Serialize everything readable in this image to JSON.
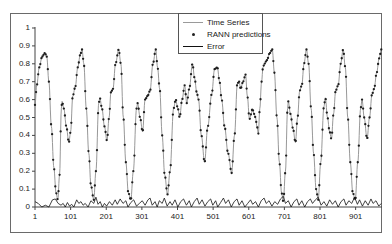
{
  "chart_data": {
    "type": "line",
    "title": "",
    "xlabel": "",
    "ylabel": "",
    "ylim": [
      0,
      1
    ],
    "xlim": [
      1,
      975
    ],
    "grid": false,
    "legend_position": "top-center-inside",
    "y_ticks": [
      "0",
      "0.1",
      "0.2",
      "0.3",
      "0.4",
      "0.5",
      "0.6",
      "0.7",
      "0.8",
      "0.9",
      "1"
    ],
    "x_ticks": [
      "1",
      "101",
      "201",
      "301",
      "401",
      "501",
      "601",
      "701",
      "801",
      "901"
    ],
    "legend": [
      "Time Series",
      "RANN predictions",
      "Error"
    ],
    "series": [
      {
        "name": "Time Series",
        "style": "line",
        "color": "#8c8c8c",
        "points": [
          [
            1,
            0.57
          ],
          [
            6,
            0.68
          ],
          [
            13,
            0.78
          ],
          [
            21,
            0.84
          ],
          [
            29,
            0.86
          ],
          [
            34,
            0.84
          ],
          [
            40,
            0.7
          ],
          [
            47,
            0.45
          ],
          [
            54,
            0.22
          ],
          [
            60,
            0.08
          ],
          [
            65,
            0.04
          ],
          [
            70,
            0.18
          ],
          [
            75,
            0.55
          ],
          [
            77,
            0.59
          ],
          [
            82,
            0.55
          ],
          [
            89,
            0.45
          ],
          [
            96,
            0.36
          ],
          [
            101,
            0.42
          ],
          [
            107,
            0.62
          ],
          [
            114,
            0.67
          ],
          [
            121,
            0.78
          ],
          [
            128,
            0.85
          ],
          [
            133,
            0.88
          ],
          [
            138,
            0.8
          ],
          [
            145,
            0.55
          ],
          [
            152,
            0.3
          ],
          [
            158,
            0.12
          ],
          [
            166,
            0.04
          ],
          [
            172,
            0.2
          ],
          [
            180,
            0.58
          ],
          [
            183,
            0.61
          ],
          [
            189,
            0.55
          ],
          [
            196,
            0.45
          ],
          [
            203,
            0.37
          ],
          [
            209,
            0.5
          ],
          [
            214,
            0.64
          ],
          [
            220,
            0.66
          ],
          [
            227,
            0.8
          ],
          [
            236,
            0.88
          ],
          [
            242,
            0.8
          ],
          [
            249,
            0.5
          ],
          [
            256,
            0.25
          ],
          [
            263,
            0.08
          ],
          [
            270,
            0.04
          ],
          [
            277,
            0.2
          ],
          [
            286,
            0.55
          ],
          [
            289,
            0.58
          ],
          [
            296,
            0.5
          ],
          [
            303,
            0.42
          ],
          [
            310,
            0.6
          ],
          [
            317,
            0.62
          ],
          [
            324,
            0.65
          ],
          [
            332,
            0.8
          ],
          [
            340,
            0.88
          ],
          [
            345,
            0.78
          ],
          [
            351,
            0.66
          ],
          [
            358,
            0.4
          ],
          [
            365,
            0.18
          ],
          [
            373,
            0.07
          ],
          [
            380,
            0.2
          ],
          [
            390,
            0.55
          ],
          [
            396,
            0.6
          ],
          [
            402,
            0.55
          ],
          [
            407,
            0.5
          ],
          [
            414,
            0.6
          ],
          [
            421,
            0.68
          ],
          [
            427,
            0.58
          ],
          [
            434,
            0.66
          ],
          [
            443,
            0.8
          ],
          [
            449,
            0.72
          ],
          [
            455,
            0.64
          ],
          [
            460,
            0.6
          ],
          [
            468,
            0.4
          ],
          [
            477,
            0.25
          ],
          [
            486,
            0.45
          ],
          [
            497,
            0.63
          ],
          [
            505,
            0.77
          ],
          [
            513,
            0.78
          ],
          [
            519,
            0.7
          ],
          [
            525,
            0.6
          ],
          [
            533,
            0.45
          ],
          [
            543,
            0.3
          ],
          [
            553,
            0.19
          ],
          [
            561,
            0.4
          ],
          [
            569,
            0.69
          ],
          [
            574,
            0.7
          ],
          [
            578,
            0.66
          ],
          [
            585,
            0.7
          ],
          [
            592,
            0.74
          ],
          [
            597,
            0.62
          ],
          [
            603,
            0.49
          ],
          [
            608,
            0.52
          ],
          [
            611,
            0.55
          ],
          [
            616,
            0.52
          ],
          [
            620,
            0.5
          ],
          [
            624,
            0.45
          ],
          [
            628,
            0.41
          ],
          [
            632,
            0.55
          ],
          [
            637,
            0.7
          ],
          [
            641,
            0.78
          ],
          [
            645,
            0.8
          ],
          [
            652,
            0.82
          ],
          [
            660,
            0.86
          ],
          [
            667,
            0.88
          ],
          [
            673,
            0.75
          ],
          [
            680,
            0.5
          ],
          [
            687,
            0.25
          ],
          [
            693,
            0.08
          ],
          [
            698,
            0.03
          ],
          [
            704,
            0.2
          ],
          [
            710,
            0.55
          ],
          [
            712,
            0.59
          ],
          [
            718,
            0.52
          ],
          [
            725,
            0.44
          ],
          [
            732,
            0.36
          ],
          [
            738,
            0.5
          ],
          [
            744,
            0.65
          ],
          [
            750,
            0.68
          ],
          [
            756,
            0.8
          ],
          [
            763,
            0.88
          ],
          [
            769,
            0.8
          ],
          [
            776,
            0.55
          ],
          [
            783,
            0.3
          ],
          [
            790,
            0.1
          ],
          [
            796,
            0.04
          ],
          [
            803,
            0.25
          ],
          [
            812,
            0.56
          ],
          [
            816,
            0.61
          ],
          [
            822,
            0.5
          ],
          [
            828,
            0.42
          ],
          [
            833,
            0.38
          ],
          [
            839,
            0.52
          ],
          [
            845,
            0.65
          ],
          [
            852,
            0.68
          ],
          [
            859,
            0.8
          ],
          [
            866,
            0.88
          ],
          [
            872,
            0.78
          ],
          [
            879,
            0.5
          ],
          [
            886,
            0.25
          ],
          [
            893,
            0.08
          ],
          [
            900,
            0.04
          ],
          [
            907,
            0.25
          ],
          [
            915,
            0.55
          ],
          [
            919,
            0.6
          ],
          [
            925,
            0.5
          ],
          [
            933,
            0.38
          ],
          [
            940,
            0.5
          ],
          [
            947,
            0.63
          ],
          [
            953,
            0.66
          ],
          [
            960,
            0.75
          ],
          [
            967,
            0.83
          ],
          [
            973,
            0.88
          ]
        ]
      },
      {
        "name": "RANN predictions",
        "style": "markers",
        "marker": "dot",
        "color": "#1e1e1e",
        "note": "Predictions closely track the Time Series values at each index"
      },
      {
        "name": "Error",
        "style": "line",
        "color": "#111111",
        "range": [
          0,
          0.06
        ],
        "points": [
          [
            1,
            0.03
          ],
          [
            10,
            0.02
          ],
          [
            20,
            0.0
          ],
          [
            30,
            0.01
          ],
          [
            40,
            0.0
          ],
          [
            50,
            0.04
          ],
          [
            58,
            0.045
          ],
          [
            66,
            0.02
          ],
          [
            74,
            0.01
          ],
          [
            80,
            0.02
          ],
          [
            86,
            0.0
          ],
          [
            92,
            0.025
          ],
          [
            98,
            0.005
          ],
          [
            104,
            0.015
          ],
          [
            110,
            0.0
          ],
          [
            118,
            0.04
          ],
          [
            124,
            0.02
          ],
          [
            130,
            0.03
          ],
          [
            136,
            0.01
          ],
          [
            142,
            0.02
          ],
          [
            150,
            0.0
          ],
          [
            158,
            0.035
          ],
          [
            166,
            0.02
          ],
          [
            172,
            0.055
          ],
          [
            178,
            0.015
          ],
          [
            184,
            0.03
          ],
          [
            190,
            0.0
          ],
          [
            196,
            0.02
          ],
          [
            202,
            0.005
          ],
          [
            210,
            0.03
          ],
          [
            218,
            0.01
          ],
          [
            226,
            0.04
          ],
          [
            232,
            0.015
          ],
          [
            240,
            0.045
          ],
          [
            248,
            0.02
          ],
          [
            256,
            0.035
          ],
          [
            262,
            0.0
          ],
          [
            270,
            0.025
          ],
          [
            278,
            0.04
          ],
          [
            286,
            0.005
          ],
          [
            294,
            0.02
          ],
          [
            302,
            0.035
          ],
          [
            310,
            0.01
          ],
          [
            318,
            0.04
          ],
          [
            324,
            0.05
          ],
          [
            330,
            0.01
          ],
          [
            338,
            0.03
          ],
          [
            344,
            0.0
          ],
          [
            350,
            0.035
          ],
          [
            358,
            0.02
          ],
          [
            364,
            0.05
          ],
          [
            372,
            0.005
          ],
          [
            380,
            0.03
          ],
          [
            386,
            0.01
          ],
          [
            394,
            0.04
          ],
          [
            402,
            0.0
          ],
          [
            410,
            0.03
          ],
          [
            418,
            0.045
          ],
          [
            426,
            0.01
          ],
          [
            434,
            0.035
          ],
          [
            440,
            0.0
          ],
          [
            448,
            0.03
          ],
          [
            456,
            0.05
          ],
          [
            462,
            0.015
          ],
          [
            470,
            0.04
          ],
          [
            478,
            0.005
          ],
          [
            486,
            0.03
          ],
          [
            494,
            0.045
          ],
          [
            500,
            0.01
          ],
          [
            508,
            0.035
          ],
          [
            514,
            0.0
          ],
          [
            522,
            0.025
          ],
          [
            530,
            0.05
          ],
          [
            536,
            0.02
          ],
          [
            544,
            0.04
          ],
          [
            552,
            0.0
          ],
          [
            560,
            0.03
          ],
          [
            568,
            0.045
          ],
          [
            574,
            0.01
          ],
          [
            582,
            0.035
          ],
          [
            590,
            0.0
          ],
          [
            598,
            0.02
          ],
          [
            606,
            0.04
          ],
          [
            612,
            0.015
          ],
          [
            620,
            0.03
          ],
          [
            628,
            0.0
          ],
          [
            636,
            0.035
          ],
          [
            644,
            0.05
          ],
          [
            650,
            0.02
          ],
          [
            658,
            0.035
          ],
          [
            666,
            0.005
          ],
          [
            674,
            0.03
          ],
          [
            682,
            0.015
          ],
          [
            690,
            0.045
          ],
          [
            698,
            0.06
          ],
          [
            704,
            0.02
          ],
          [
            712,
            0.035
          ],
          [
            720,
            0.0
          ],
          [
            728,
            0.03
          ],
          [
            736,
            0.045
          ],
          [
            742,
            0.01
          ],
          [
            750,
            0.035
          ],
          [
            758,
            0.0
          ],
          [
            766,
            0.03
          ],
          [
            774,
            0.045
          ],
          [
            780,
            0.02
          ],
          [
            788,
            0.04
          ],
          [
            796,
            0.055
          ],
          [
            804,
            0.01
          ],
          [
            812,
            0.03
          ],
          [
            820,
            0.005
          ],
          [
            828,
            0.04
          ],
          [
            836,
            0.015
          ],
          [
            844,
            0.035
          ],
          [
            852,
            0.0
          ],
          [
            860,
            0.03
          ],
          [
            868,
            0.045
          ],
          [
            874,
            0.01
          ],
          [
            882,
            0.035
          ],
          [
            890,
            0.02
          ],
          [
            898,
            0.055
          ],
          [
            906,
            0.015
          ],
          [
            912,
            0.04
          ],
          [
            920,
            0.005
          ],
          [
            928,
            0.035
          ],
          [
            936,
            0.01
          ],
          [
            944,
            0.045
          ],
          [
            950,
            0.02
          ],
          [
            958,
            0.035
          ],
          [
            966,
            0.005
          ],
          [
            973,
            0.02
          ]
        ]
      }
    ]
  },
  "axes": {
    "y_ticks": [
      "0",
      "0.1",
      "0.2",
      "0.3",
      "0.4",
      "0.5",
      "0.6",
      "0.7",
      "0.8",
      "0.9",
      "1"
    ],
    "x_ticks": [
      "1",
      "101",
      "201",
      "301",
      "401",
      "501",
      "601",
      "701",
      "801",
      "901"
    ]
  },
  "legend": {
    "items": [
      {
        "label": "Time Series",
        "symbol": "grey-line"
      },
      {
        "label": "RANN predictions",
        "symbol": "dot-marker"
      },
      {
        "label": "Error",
        "symbol": "black-line"
      }
    ]
  }
}
